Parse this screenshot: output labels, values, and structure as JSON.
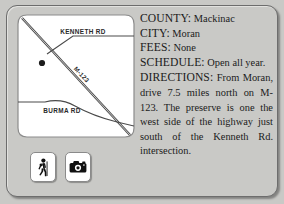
{
  "card": {
    "background_color": "#c9c9c6",
    "frame_color": "#6d6d6d"
  },
  "map": {
    "title": "preserve-location-map",
    "panel_background": "#ffffff",
    "roads": [
      {
        "name": "KENNETH RD",
        "label": "KENNETH RD",
        "type": "local"
      },
      {
        "name": "BURMA RD",
        "label": "BURMA RD",
        "type": "local"
      },
      {
        "name": "M-123",
        "label": "M-123",
        "type": "highway"
      }
    ],
    "marker": {
      "name": "preserve-marker",
      "label": ""
    }
  },
  "amenities": [
    {
      "icon": "hiker-icon",
      "label": "Hiking"
    },
    {
      "icon": "camera-icon",
      "label": "Photography"
    }
  ],
  "info": {
    "county": {
      "label": "COUNTY:",
      "value": "Mackinac"
    },
    "city": {
      "label": "CITY:",
      "value": "Moran"
    },
    "fees": {
      "label": "FEES:",
      "value": "None"
    },
    "schedule": {
      "label": "SCHEDULE:",
      "value": "Open all year."
    },
    "directions": {
      "label": "DIRECTIONS:",
      "value": "From Moran, drive 7.5 miles north on M-123. The preserve is one the west side of the highway just south of the Kenneth Rd. intersection."
    }
  }
}
